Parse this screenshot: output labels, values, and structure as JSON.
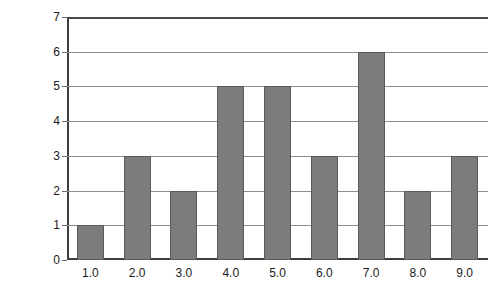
{
  "chart_data": {
    "type": "bar",
    "title": "",
    "subtitle": "",
    "xlabel": "",
    "ylabel": "Frequency",
    "categories": [
      "1.0",
      "2.0",
      "3.0",
      "4.0",
      "5.0",
      "6.0",
      "7.0",
      "8.0",
      "9.0"
    ],
    "values": [
      1,
      3,
      2,
      5,
      5,
      3,
      6,
      2,
      3
    ],
    "ylim": [
      0,
      7
    ],
    "y_ticks": [
      "0",
      "1",
      "2",
      "3",
      "4",
      "5",
      "6",
      "7"
    ],
    "grid": "horizontal",
    "legend": "none",
    "annotations": [],
    "colors": {
      "bar_fill": "#7c7c7c",
      "bar_outline": "#5a5a5a",
      "gridline": "#8d8d8d",
      "axis": "#3d3d3d",
      "text": "#1a1a1a",
      "background": "#ffffff"
    }
  }
}
